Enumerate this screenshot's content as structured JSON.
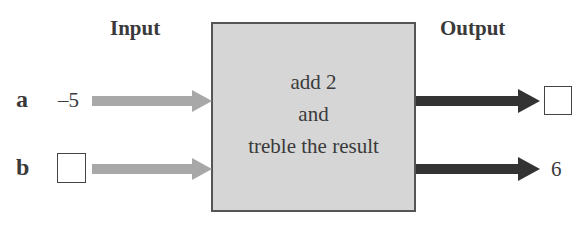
{
  "headers": {
    "input": "Input",
    "output": "Output"
  },
  "machine": {
    "lines": [
      "add 2",
      "and",
      "treble the result"
    ],
    "fill_color": "#d6d6d6"
  },
  "rows": [
    {
      "variable": "a",
      "input_value": "–5",
      "input_blank": false,
      "output_value": "",
      "output_blank": true
    },
    {
      "variable": "b",
      "input_value": "",
      "input_blank": true,
      "output_value": "6",
      "output_blank": false
    }
  ],
  "colors": {
    "input_arrow": "#a8a8a8",
    "output_arrow": "#333333"
  }
}
